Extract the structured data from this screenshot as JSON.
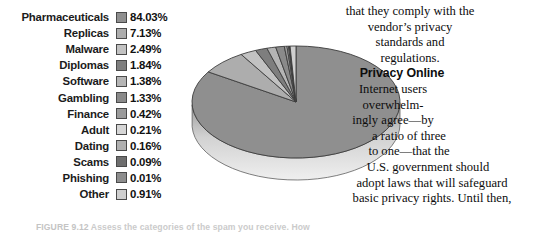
{
  "figure": {
    "caption_id": "FIGURE 9.12",
    "caption_text": "Assess the categories of the spam you receive. How"
  },
  "legend": {
    "items": [
      {
        "label": "Pharmaceuticals",
        "value": "84.03%",
        "color": "#8f8f8f"
      },
      {
        "label": "Replicas",
        "value": "7.13%",
        "color": "#adadad"
      },
      {
        "label": "Malware",
        "value": "2.49%",
        "color": "#c2c2c2"
      },
      {
        "label": "Diplomas",
        "value": "1.84%",
        "color": "#7e7e7e"
      },
      {
        "label": "Software",
        "value": "1.38%",
        "color": "#b5b5b5"
      },
      {
        "label": "Gambling",
        "value": "1.33%",
        "color": "#8a8a8a"
      },
      {
        "label": "Finance",
        "value": "0.42%",
        "color": "#9b9b9b"
      },
      {
        "label": "Adult",
        "value": "0.21%",
        "color": "#d6d6d6"
      },
      {
        "label": "Dating",
        "value": "0.16%",
        "color": "#b0b0b0"
      },
      {
        "label": "Scams",
        "value": "0.09%",
        "color": "#6e6e6e"
      },
      {
        "label": "Phishing",
        "value": "0.01%",
        "color": "#8d8d8d"
      },
      {
        "label": "Other",
        "value": "0.91%",
        "color": "#cfcfcf"
      }
    ]
  },
  "chart_data": {
    "type": "pie",
    "title": "",
    "three_d": true,
    "start_angle_deg": -90,
    "direction": "clockwise",
    "categories": [
      "Pharmaceuticals",
      "Replicas",
      "Malware",
      "Diplomas",
      "Software",
      "Gambling",
      "Finance",
      "Adult",
      "Dating",
      "Scams",
      "Phishing",
      "Other"
    ],
    "values": [
      84.03,
      7.13,
      2.49,
      1.84,
      1.38,
      1.33,
      0.42,
      0.21,
      0.16,
      0.09,
      0.01,
      0.91
    ],
    "unit": "percent",
    "colors": [
      "#8f8f8f",
      "#adadad",
      "#c2c2c2",
      "#7e7e7e",
      "#b5b5b5",
      "#8a8a8a",
      "#9b9b9b",
      "#d6d6d6",
      "#b0b0b0",
      "#6e6e6e",
      "#8d8d8d",
      "#cfcfcf"
    ],
    "legend_position": "left",
    "grid": false,
    "xlabel": "",
    "ylabel": ""
  },
  "body": {
    "para_1_line_1": "that they comply with the",
    "para_1_line_2": "vendor’s privacy",
    "para_1_line_3": "standards and",
    "para_1_line_4": "regulations.",
    "heading": "Privacy Online",
    "para_2_line_1": "Internet users",
    "para_2_line_2": "overwhelm-",
    "para_2_line_3": "ingly agree—by",
    "para_2_line_4": "a ratio of three",
    "para_2_line_5": "to one—that the",
    "para_2_line_6": "U.S. government should",
    "para_2_line_7": "adopt laws that will safeguard",
    "para_2_line_8": "basic privacy rights. Until then,"
  }
}
